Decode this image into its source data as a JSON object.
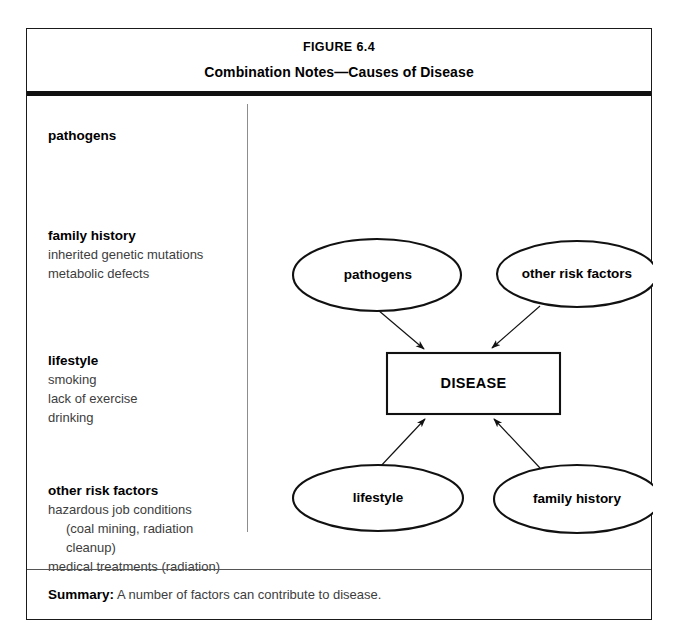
{
  "figure": {
    "number": "FIGURE 6.4",
    "title": "Combination Notes—Causes of Disease"
  },
  "notes": {
    "groups": [
      {
        "heading": "pathogens",
        "details": []
      },
      {
        "heading": "family history",
        "details": [
          {
            "text": "inherited genetic mutations",
            "indented": false
          },
          {
            "text": "metabolic defects",
            "indented": false
          }
        ]
      },
      {
        "heading": "lifestyle",
        "details": [
          {
            "text": "smoking",
            "indented": false
          },
          {
            "text": "lack of exercise",
            "indented": false
          },
          {
            "text": "drinking",
            "indented": false
          }
        ]
      },
      {
        "heading": "other risk factors",
        "details": [
          {
            "text": "hazardous job conditions",
            "indented": false
          },
          {
            "text": "(coal mining, radiation",
            "indented": true
          },
          {
            "text": "cleanup)",
            "indented": true
          },
          {
            "text": "medical treatments (radiation)",
            "indented": false
          }
        ]
      }
    ]
  },
  "diagram": {
    "type": "concept-map",
    "center_node": {
      "label": "DISEASE",
      "shape": "rectangle"
    },
    "nodes": [
      {
        "label": "pathogens",
        "shape": "ellipse",
        "position": "top-left"
      },
      {
        "label": "other risk factors",
        "shape": "ellipse",
        "position": "top-right"
      },
      {
        "label": "lifestyle",
        "shape": "ellipse",
        "position": "bottom-left"
      },
      {
        "label": "family history",
        "shape": "ellipse",
        "position": "bottom-right"
      }
    ],
    "edges": [
      {
        "from": "pathogens",
        "to": "DISEASE",
        "arrow": "to"
      },
      {
        "from": "other risk factors",
        "to": "DISEASE",
        "arrow": "to"
      },
      {
        "from": "lifestyle",
        "to": "DISEASE",
        "arrow": "to"
      },
      {
        "from": "family history",
        "to": "DISEASE",
        "arrow": "to"
      }
    ],
    "stroke_color": "#111111",
    "fill_color": "#ffffff"
  },
  "summary": {
    "label": "Summary:",
    "text": " A number of factors can contribute to disease."
  }
}
